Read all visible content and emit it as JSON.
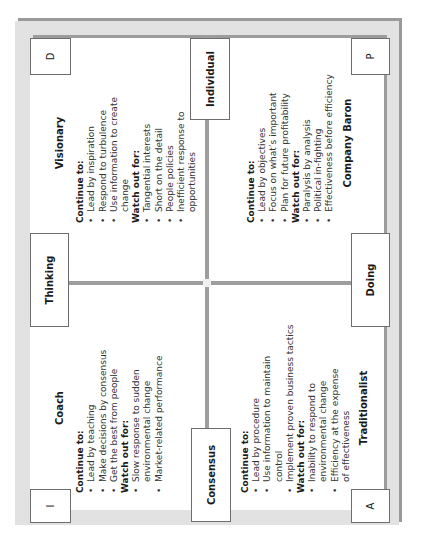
{
  "axes": {
    "top": "Thinking",
    "bottom": "Doing",
    "left": "Consensus",
    "right": "Individual"
  },
  "corners": {
    "top_left": "I",
    "top_right": "D",
    "bottom_left": "A",
    "bottom_right": "P"
  },
  "quadrants": {
    "coach": {
      "title": "Coach",
      "continue_label": "Continue to:",
      "continue": [
        "Lead by teaching",
        "Make decisions by consensus",
        "Get the best from people"
      ],
      "watch_label": "Watch out for:",
      "watch": [
        "Slow response to sudden environmental change",
        "Market-related performance"
      ]
    },
    "visionary": {
      "title": "Visionary",
      "continue_label": "Continue to:",
      "continue": [
        "Lead by inspiration",
        "Respond to turbulence",
        "Use information to create change"
      ],
      "watch_label": "Watch out for:",
      "watch": [
        "Tangential interests",
        "Short on the detail",
        "People policies",
        "Inefficient response to opportunities"
      ]
    },
    "traditionalist": {
      "title": "Traditionalist",
      "continue_label": "Continue to:",
      "continue": [
        "Lead by procedure",
        "Use information to maintain control",
        "Implement proven business tactics"
      ],
      "watch_label": "Watch out for:",
      "watch": [
        "Inability to respond to environmental change",
        "Efficiency at the expense of effectiveness"
      ]
    },
    "company_baron": {
      "title": "Company Baron",
      "continue_label": "Continue to:",
      "continue": [
        "Lead by objectives",
        "Focus on what’s important",
        "Plan for future profitability"
      ],
      "watch_label": "Watch out for:",
      "watch": [
        "Paralysis by analysis",
        "Political in-fighting",
        "Effectiveness before efficiency"
      ]
    }
  },
  "colors": {
    "frame": "#e2e2e2",
    "shadow": "#9a9a9a",
    "divider": "#9e9e9e",
    "panel": "#ffffff",
    "border": "#6d6d6d"
  }
}
